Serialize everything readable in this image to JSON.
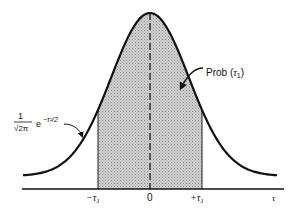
{
  "figure": {
    "type": "standard normal distribution diagram",
    "curve_label": {
      "coefficient_numerator": "1",
      "coefficient_denominator": "√2π",
      "exp_base": "e",
      "exp_power": "−τ²/2"
    },
    "shaded_label": {
      "text": "Prob (",
      "symbol": "τ",
      "subscript": "1",
      "close": ")"
    },
    "axis": {
      "tick_labels": [
        {
          "label": "−τ",
          "sub": "1",
          "x": 98
        },
        {
          "label": "0",
          "sub": "",
          "x": 150
        },
        {
          "label": "+τ",
          "sub": "1",
          "x": 202
        }
      ],
      "axis_label": "τ"
    },
    "colors": {
      "line": "#111111",
      "shade": "#b8b8b8",
      "background": "#ffffff"
    }
  },
  "chart_data": {
    "type": "area",
    "title": "",
    "function": "(1/√(2π)) e^(−τ²/2)",
    "xlabel": "τ",
    "ylabel": "",
    "x_ticks": [
      "−τ1",
      "0",
      "+τ1"
    ],
    "shaded_interval": [
      "−τ1",
      "+τ1"
    ],
    "shaded_label": "Prob (τ1)",
    "center_line": "dashed at τ = 0"
  }
}
